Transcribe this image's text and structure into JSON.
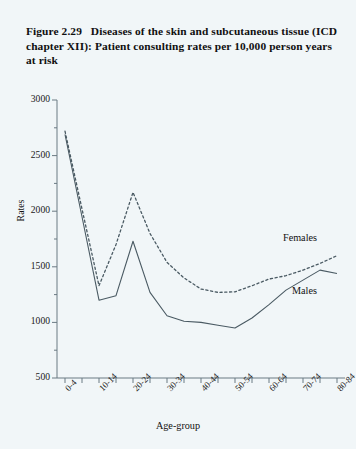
{
  "figure": {
    "number": "Figure 2.29",
    "title": "Diseases of the skin and subcutaneous tissue (ICD chapter XII): Patient consulting  rates per 10,000 person years at risk",
    "background_color": "#f1f6f8",
    "line_color": "#4a5a63"
  },
  "axes": {
    "y_title": "Rates",
    "x_title": "Age-group",
    "y_ticks": [
      "500",
      "1000",
      "1500",
      "2000",
      "2500",
      "3000"
    ],
    "x_ticks_visible": [
      "0-4",
      "10-14",
      "20-24",
      "30-34",
      "40-44",
      "50-54",
      "60-64",
      "70-74",
      "80-84"
    ]
  },
  "legend": {
    "females": "Females",
    "males": "Males"
  },
  "chart_data": {
    "type": "line",
    "xlabel": "Age-group",
    "ylabel": "Rates",
    "ylim": [
      500,
      3000
    ],
    "yticks": [
      500,
      1000,
      1500,
      2000,
      2500,
      3000
    ],
    "grid": false,
    "legend_position": "inline-right",
    "categories": [
      "0-4",
      "5-9",
      "10-14",
      "15-19",
      "20-24",
      "25-29",
      "30-34",
      "35-39",
      "40-44",
      "45-49",
      "50-54",
      "55-59",
      "60-64",
      "65-69",
      "70-74",
      "75-79",
      "80-84"
    ],
    "series": [
      {
        "name": "Males",
        "style": "solid",
        "values": [
          2690,
          1950,
          1200,
          1240,
          1730,
          1270,
          1060,
          1010,
          1000,
          975,
          950,
          1040,
          1160,
          1290,
          1380,
          1470,
          1440
        ]
      },
      {
        "name": "Females",
        "style": "dashed",
        "values": [
          2720,
          2020,
          1330,
          1700,
          2170,
          1800,
          1540,
          1400,
          1300,
          1270,
          1275,
          1330,
          1390,
          1420,
          1470,
          1530,
          1600
        ]
      }
    ]
  }
}
